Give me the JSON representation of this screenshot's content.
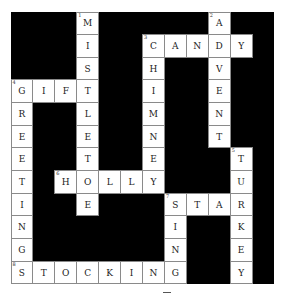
{
  "puzzle": {
    "rows": 12,
    "cols": 12,
    "colors": {
      "block": "#000000",
      "cell": "#ffffff",
      "border": "#8a8a8a"
    },
    "cells": [
      {
        "r": 1,
        "c": 4,
        "letter": "M",
        "num": "1"
      },
      {
        "r": 1,
        "c": 10,
        "letter": "A",
        "num": "2"
      },
      {
        "r": 2,
        "c": 4,
        "letter": "I"
      },
      {
        "r": 2,
        "c": 7,
        "letter": "C",
        "num": "3"
      },
      {
        "r": 2,
        "c": 8,
        "letter": "A"
      },
      {
        "r": 2,
        "c": 9,
        "letter": "N"
      },
      {
        "r": 2,
        "c": 10,
        "letter": "D"
      },
      {
        "r": 2,
        "c": 11,
        "letter": "Y"
      },
      {
        "r": 3,
        "c": 4,
        "letter": "S"
      },
      {
        "r": 3,
        "c": 7,
        "letter": "H"
      },
      {
        "r": 3,
        "c": 10,
        "letter": "V"
      },
      {
        "r": 4,
        "c": 1,
        "letter": "G",
        "num": "4"
      },
      {
        "r": 4,
        "c": 2,
        "letter": "I"
      },
      {
        "r": 4,
        "c": 3,
        "letter": "F"
      },
      {
        "r": 4,
        "c": 4,
        "letter": "T"
      },
      {
        "r": 4,
        "c": 7,
        "letter": "I"
      },
      {
        "r": 4,
        "c": 10,
        "letter": "E"
      },
      {
        "r": 5,
        "c": 1,
        "letter": "R"
      },
      {
        "r": 5,
        "c": 4,
        "letter": "L"
      },
      {
        "r": 5,
        "c": 7,
        "letter": "M"
      },
      {
        "r": 5,
        "c": 10,
        "letter": "N"
      },
      {
        "r": 6,
        "c": 1,
        "letter": "E"
      },
      {
        "r": 6,
        "c": 4,
        "letter": "E"
      },
      {
        "r": 6,
        "c": 7,
        "letter": "N"
      },
      {
        "r": 6,
        "c": 10,
        "letter": "T"
      },
      {
        "r": 7,
        "c": 1,
        "letter": "E"
      },
      {
        "r": 7,
        "c": 4,
        "letter": "T"
      },
      {
        "r": 7,
        "c": 7,
        "letter": "E"
      },
      {
        "r": 7,
        "c": 11,
        "letter": "T",
        "num": "5"
      },
      {
        "r": 8,
        "c": 1,
        "letter": "T"
      },
      {
        "r": 8,
        "c": 3,
        "letter": "H",
        "num": "6"
      },
      {
        "r": 8,
        "c": 4,
        "letter": "O"
      },
      {
        "r": 8,
        "c": 5,
        "letter": "L"
      },
      {
        "r": 8,
        "c": 6,
        "letter": "L"
      },
      {
        "r": 8,
        "c": 7,
        "letter": "Y"
      },
      {
        "r": 8,
        "c": 11,
        "letter": "U"
      },
      {
        "r": 9,
        "c": 1,
        "letter": "I"
      },
      {
        "r": 9,
        "c": 4,
        "letter": "E"
      },
      {
        "r": 9,
        "c": 8,
        "letter": "S",
        "num": "7"
      },
      {
        "r": 9,
        "c": 9,
        "letter": "T"
      },
      {
        "r": 9,
        "c": 10,
        "letter": "A"
      },
      {
        "r": 9,
        "c": 11,
        "letter": "R"
      },
      {
        "r": 10,
        "c": 1,
        "letter": "N"
      },
      {
        "r": 10,
        "c": 8,
        "letter": "I"
      },
      {
        "r": 10,
        "c": 11,
        "letter": "K"
      },
      {
        "r": 11,
        "c": 1,
        "letter": "G"
      },
      {
        "r": 11,
        "c": 8,
        "letter": "N"
      },
      {
        "r": 11,
        "c": 11,
        "letter": "E"
      },
      {
        "r": 12,
        "c": 1,
        "letter": "S",
        "num": "8"
      },
      {
        "r": 12,
        "c": 2,
        "letter": "T"
      },
      {
        "r": 12,
        "c": 3,
        "letter": "O"
      },
      {
        "r": 12,
        "c": 4,
        "letter": "C"
      },
      {
        "r": 12,
        "c": 5,
        "letter": "K"
      },
      {
        "r": 12,
        "c": 6,
        "letter": "I"
      },
      {
        "r": 12,
        "c": 7,
        "letter": "N"
      },
      {
        "r": 12,
        "c": 8,
        "letter": "G"
      },
      {
        "r": 12,
        "c": 11,
        "letter": "Y"
      }
    ],
    "words": {
      "across": [
        {
          "num": "3",
          "answer": "CANDY"
        },
        {
          "num": "4",
          "answer": "GIFT"
        },
        {
          "num": "6",
          "answer": "HOLLY"
        },
        {
          "num": "7",
          "answer": "STAR"
        },
        {
          "num": "8",
          "answer": "STOCKING"
        }
      ],
      "down": [
        {
          "num": "1",
          "answer": "MISTLETOE"
        },
        {
          "num": "2",
          "answer": "ADVENT"
        },
        {
          "num": "3",
          "answer": "CHIMNEY"
        },
        {
          "num": "4",
          "answer": "GREETING"
        },
        {
          "num": "5",
          "answer": "TURKEY"
        },
        {
          "num": "7",
          "answer": "SING"
        }
      ]
    }
  }
}
